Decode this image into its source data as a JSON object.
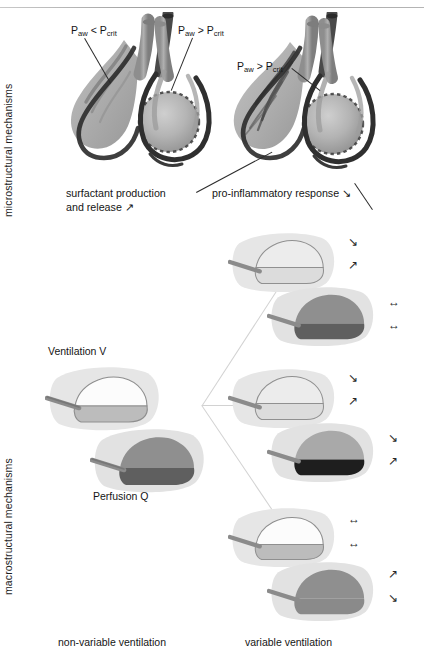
{
  "figure": {
    "axis_labels": {
      "micro": "microstructural mechanisms",
      "macro": "macrostructural mechanisms"
    },
    "bottom_labels": {
      "left": "non-variable ventilation",
      "right": "variable ventilation"
    }
  },
  "micro": {
    "left_cluster": {
      "pressure_label_collapsed": {
        "p": "P",
        "sub1": "aw",
        "rel": "<",
        "p2": "P",
        "sub2": "crit"
      },
      "pressure_label_open": {
        "p": "P",
        "sub1": "aw",
        "rel": ">",
        "p2": "P",
        "sub2": "crit"
      },
      "caption_line1": "surfactant production",
      "caption_line2": "and release ↗"
    },
    "right_cluster": {
      "pressure_label_open": {
        "p": "P",
        "sub1": "aw",
        "rel": ">",
        "p2": "P",
        "sub2": "crit"
      },
      "caption": "pro-inflammatory response ↘"
    }
  },
  "macro": {
    "source_group": {
      "ventilation_label": "Ventilation V",
      "perfusion_label": "Perfusion Q"
    },
    "outcome_groups": [
      {
        "id": "top",
        "ventilation_arrows": [
          "↘",
          "↗"
        ],
        "perfusion_arrows": [
          "↔",
          "↔"
        ]
      },
      {
        "id": "middle",
        "ventilation_arrows": [
          "↘",
          "↗"
        ],
        "perfusion_arrows": [
          "↘",
          "↗"
        ]
      },
      {
        "id": "bottom",
        "ventilation_arrows": [
          "↔",
          "↔"
        ],
        "perfusion_arrows": [
          "↗",
          "↘"
        ]
      }
    ]
  },
  "colors": {
    "body_pale": "#e2e2e2",
    "vent_upper": "#fbfbfb",
    "vent_lower": "#b9b9b9",
    "perf_upper": "#8f8f8f",
    "perf_lower": "#6a6a6a",
    "perf_lower_dark": "#232323",
    "airway_stub": "#8a8a8a",
    "outline": "#9a9a9a",
    "text": "#151515",
    "leader": "#2b2b2b",
    "fan": "#d2d2d2"
  }
}
